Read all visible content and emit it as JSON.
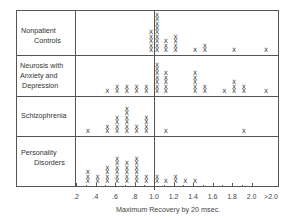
{
  "chart_data": {
    "type": "scatter",
    "subtype": "dot-plot (stacked X marks per bin)",
    "title": "",
    "xlabel": "Maximum Recovery by 20 msec.",
    "xlabel_sub": "(smoothed curve)",
    "ylabel": "",
    "x_ticks": [
      ".2",
      ".4",
      ".6",
      ".8",
      "1.0",
      "1.2",
      "1.4",
      "1.6",
      "1.8",
      "2.0",
      ">2.0"
    ],
    "xlim": [
      0.2,
      2.1
    ],
    "reference_line": 1.0,
    "marker": "X",
    "groups": [
      {
        "name": "Nonpatient Controls",
        "label_lines": [
          "Nonpatient",
          "Controls"
        ],
        "bins": [
          {
            "x": 0.95,
            "count": 5
          },
          {
            "x": 1.0,
            "count": 9
          },
          {
            "x": 1.1,
            "count": 3
          },
          {
            "x": 1.2,
            "count": 4
          },
          {
            "x": 1.4,
            "count": 1
          },
          {
            "x": 1.5,
            "count": 2
          },
          {
            "x": 1.8,
            "count": 1
          },
          {
            "x": 2.1,
            "count": 1
          }
        ]
      },
      {
        "name": "Neurosis with Anxiety and Depression",
        "label_lines": [
          "Neurosis with",
          "Anxiety and",
          "Depression"
        ],
        "bins": [
          {
            "x": 0.5,
            "count": 1
          },
          {
            "x": 0.6,
            "count": 2
          },
          {
            "x": 0.7,
            "count": 2
          },
          {
            "x": 0.8,
            "count": 2
          },
          {
            "x": 0.9,
            "count": 2
          },
          {
            "x": 1.0,
            "count": 7
          },
          {
            "x": 1.1,
            "count": 5
          },
          {
            "x": 1.4,
            "count": 5
          },
          {
            "x": 1.5,
            "count": 2
          },
          {
            "x": 1.7,
            "count": 1
          },
          {
            "x": 1.8,
            "count": 3
          },
          {
            "x": 1.9,
            "count": 2
          },
          {
            "x": 2.1,
            "count": 1
          }
        ]
      },
      {
        "name": "Schizophrenia",
        "label_lines": [
          "Schizophrenia"
        ],
        "bins": [
          {
            "x": 0.3,
            "count": 1
          },
          {
            "x": 0.5,
            "count": 2
          },
          {
            "x": 0.6,
            "count": 4
          },
          {
            "x": 0.7,
            "count": 6
          },
          {
            "x": 0.8,
            "count": 2
          },
          {
            "x": 0.9,
            "count": 4
          },
          {
            "x": 1.1,
            "count": 1
          },
          {
            "x": 1.9,
            "count": 1
          }
        ]
      },
      {
        "name": "Personality Disorders",
        "label_lines": [
          "Personality",
          "Disorders"
        ],
        "bins": [
          {
            "x": 0.3,
            "count": 3
          },
          {
            "x": 0.4,
            "count": 2
          },
          {
            "x": 0.5,
            "count": 4
          },
          {
            "x": 0.6,
            "count": 6
          },
          {
            "x": 0.7,
            "count": 5
          },
          {
            "x": 0.8,
            "count": 6
          },
          {
            "x": 0.9,
            "count": 2
          },
          {
            "x": 1.0,
            "count": 2
          },
          {
            "x": 1.1,
            "count": 1
          },
          {
            "x": 1.2,
            "count": 2
          },
          {
            "x": 1.3,
            "count": 1
          },
          {
            "x": 1.4,
            "count": 1
          }
        ]
      }
    ],
    "grid": false,
    "legend": "none"
  },
  "labels": {
    "row1_l1": "Nonpatient",
    "row1_l2": "Controls",
    "row2_l1": "Neurosis with",
    "row2_l2": "Anxiety and",
    "row2_l3": "Depression",
    "row3_l1": "Schizophrenia",
    "row4_l1": "Personality",
    "row4_l2": "Disorders",
    "xlabel": "Maximum Recovery by 20 msec.",
    "xlabel_sub": "(smoothed curve)"
  }
}
